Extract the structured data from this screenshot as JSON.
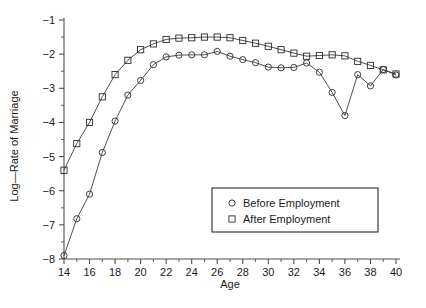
{
  "chart_data": {
    "type": "line",
    "title": "",
    "xlabel": "Age",
    "ylabel": "Log—Rate of Marriage",
    "xlim": [
      14,
      40
    ],
    "ylim": [
      -8,
      -1
    ],
    "xticks": [
      14,
      16,
      18,
      20,
      22,
      24,
      26,
      28,
      30,
      32,
      34,
      36,
      38,
      40
    ],
    "xtick_labels": [
      "14",
      "16",
      "18",
      "20",
      "22",
      "24",
      "26",
      "28",
      "30",
      "32",
      "34",
      "36",
      "38",
      "40"
    ],
    "yticks": [
      -1,
      -2,
      -3,
      -4,
      -5,
      -6,
      -7,
      -8
    ],
    "ytick_labels": [
      "−1",
      "−2",
      "−3",
      "−4",
      "−5",
      "−6",
      "−7",
      "−8"
    ],
    "minor_xticks": [
      15,
      17,
      19,
      21,
      23,
      25,
      27,
      29,
      31,
      33,
      35,
      37,
      39
    ],
    "minor_yticks": [
      -1.5,
      -2.5,
      -3.5,
      -4.5,
      -5.5,
      -6.5,
      -7.5
    ],
    "grid": false,
    "legend_position": "lower-right",
    "x": [
      14,
      15,
      16,
      17,
      18,
      19,
      20,
      21,
      22,
      23,
      24,
      25,
      26,
      27,
      28,
      29,
      30,
      31,
      32,
      33,
      34,
      35,
      36,
      37,
      38,
      39,
      40
    ],
    "series": [
      {
        "name": "Before Employment",
        "marker": "circle",
        "values": [
          -7.9,
          -6.82,
          -6.1,
          -4.88,
          -3.96,
          -3.2,
          -2.77,
          -2.31,
          -2.08,
          -2.03,
          -2.02,
          -2.02,
          -1.92,
          -2.06,
          -2.16,
          -2.25,
          -2.38,
          -2.4,
          -2.39,
          -2.26,
          -2.53,
          -3.12,
          -3.8,
          -2.6,
          -2.93,
          -2.45,
          -2.61
        ]
      },
      {
        "name": "After Employment",
        "marker": "square",
        "values": [
          -5.4,
          -4.62,
          -4.0,
          -3.25,
          -2.6,
          -2.18,
          -1.87,
          -1.7,
          -1.57,
          -1.53,
          -1.52,
          -1.5,
          -1.5,
          -1.52,
          -1.6,
          -1.68,
          -1.77,
          -1.87,
          -1.97,
          -2.06,
          -2.04,
          -2.02,
          -2.05,
          -2.21,
          -2.33,
          -2.46,
          -2.58
        ]
      }
    ],
    "legend_entries": [
      {
        "label": "Before Employment",
        "marker": "circle"
      },
      {
        "label": "After Employment",
        "marker": "square"
      }
    ]
  },
  "axes": {
    "x_title": "Age",
    "y_title": "Log—Rate of Marriage"
  }
}
